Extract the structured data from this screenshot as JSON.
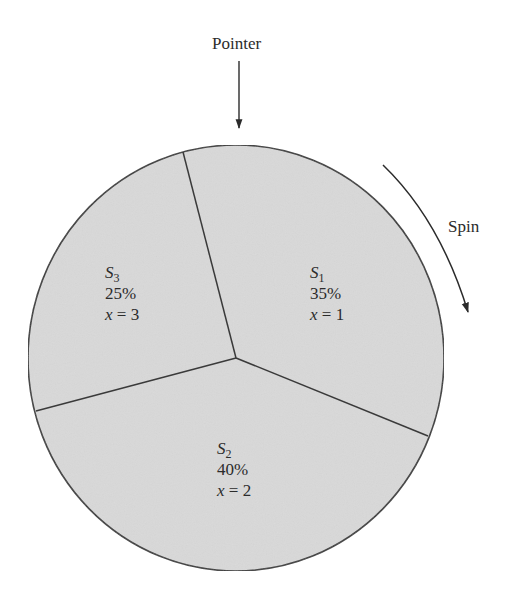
{
  "diagram": {
    "type": "spinner-wheel",
    "pointer_label": "Pointer",
    "spin_label": "Spin",
    "fill_color": "#d9d9d9",
    "stroke_color": "#3a3a3a",
    "sectors": [
      {
        "name": "S",
        "subscript": "1",
        "percent": "35%",
        "var": "x",
        "eq": "=",
        "value": "1"
      },
      {
        "name": "S",
        "subscript": "2",
        "percent": "40%",
        "var": "x",
        "eq": "=",
        "value": "2"
      },
      {
        "name": "S",
        "subscript": "3",
        "percent": "25%",
        "var": "x",
        "eq": "=",
        "value": "3"
      }
    ]
  }
}
